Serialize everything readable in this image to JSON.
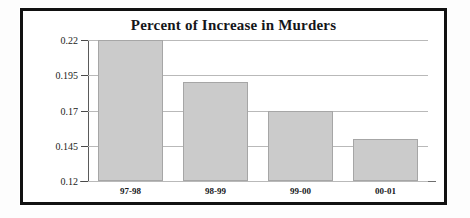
{
  "chart_data": {
    "type": "bar",
    "title": "Percent of Increase in Murders",
    "xlabel": "",
    "ylabel": "",
    "categories": [
      "97-98",
      "98-99",
      "99-00",
      "00-01"
    ],
    "values": [
      0.22,
      0.19,
      0.17,
      0.15
    ],
    "ylim": [
      0.12,
      0.22
    ],
    "ytick_labels": [
      "0.22",
      "0.195",
      "0.17",
      "0.145",
      "0.12"
    ],
    "ytick_values": [
      0.22,
      0.195,
      0.17,
      0.145,
      0.12
    ],
    "grid": true,
    "legend": false,
    "series": [
      {
        "name": "Percent of Increase in Murders",
        "values": [
          0.22,
          0.19,
          0.17,
          0.15
        ]
      }
    ],
    "colors": {
      "bar_fill": "#cbcbcb",
      "bar_border": "#a6a6a6",
      "gridline": "#b9b9b9",
      "axis": "#5a5a5a",
      "frame": "#111111",
      "background": "#ffffff",
      "text": "#16171b"
    }
  }
}
